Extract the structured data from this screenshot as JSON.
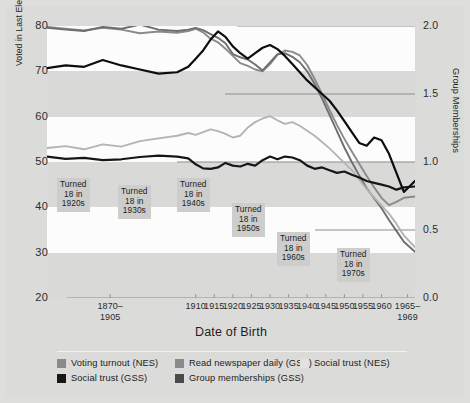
{
  "chart_data": {
    "type": "line",
    "title": "",
    "xlabel": "Date of Birth",
    "ylabel": "Voted in Last Election / Read Newspaper Daily / \"Most People Can Be Trusted\"",
    "y2label": "Group Memberships",
    "xlim": [
      1870,
      1969
    ],
    "ylim": [
      20,
      80
    ],
    "y2lim": [
      0.0,
      2.0
    ],
    "grid": true,
    "legend_position": "bottom-left",
    "yticks": [
      20,
      30,
      40,
      50,
      60,
      70,
      80
    ],
    "y2ticks": [
      "0.0",
      "0.5",
      "1.0",
      "1.5",
      "2.0"
    ],
    "xtick_labels": [
      "1870–\n1905",
      "1910",
      "1915",
      "1920",
      "1925",
      "1930",
      "1935",
      "1940",
      "1945",
      "1950",
      "1955",
      "1960",
      "1965–\n1969"
    ],
    "x": [
      1870,
      1875,
      1880,
      1885,
      1890,
      1895,
      1900,
      1905,
      1908,
      1910,
      1912,
      1914,
      1916,
      1918,
      1920,
      1922,
      1924,
      1926,
      1928,
      1930,
      1932,
      1934,
      1936,
      1938,
      1940,
      1942,
      1944,
      1946,
      1948,
      1950,
      1952,
      1954,
      1956,
      1958,
      1960,
      1962,
      1964,
      1966,
      1969
    ],
    "series": [
      {
        "name": "Voting turnout (NES)",
        "color": "#8a8a8a",
        "axis": "left",
        "values": [
          79.8,
          79.4,
          79.0,
          79.6,
          79.2,
          78.4,
          78.8,
          78.5,
          78.9,
          79.4,
          78.6,
          77.2,
          76.4,
          75.0,
          73.4,
          71.8,
          71.2,
          70.4,
          70.0,
          71.6,
          73.6,
          74.6,
          74.3,
          73.5,
          71.4,
          68.3,
          65.0,
          61.5,
          58.2,
          55.1,
          52.3,
          49.6,
          46.9,
          44.4,
          42.1,
          40.5,
          41.2,
          42.1,
          42.4
        ]
      },
      {
        "name": "Read newspaper daily (GSS)",
        "color": "#6e6e6e",
        "axis": "left",
        "values": [
          79.6,
          79.2,
          78.9,
          79.8,
          79.4,
          80.3,
          79.2,
          78.9,
          79.2,
          79.6,
          79.1,
          78.2,
          77.4,
          76.2,
          73.8,
          73.1,
          72.6,
          71.5,
          70.2,
          72.0,
          73.8,
          74.0,
          73.2,
          72.0,
          70.0,
          67.2,
          64.0,
          60.4,
          56.8,
          53.2,
          50.0,
          47.0,
          44.2,
          42.0,
          39.8,
          37.2,
          34.8,
          32.4,
          30.2
        ]
      },
      {
        "name": "Social trust (NES)",
        "color": "#b4b4b4",
        "axis": "left",
        "values": [
          53.1,
          53.5,
          52.8,
          53.9,
          53.4,
          54.6,
          55.2,
          55.8,
          56.4,
          56.0,
          56.6,
          57.2,
          56.8,
          56.2,
          55.4,
          55.8,
          57.6,
          58.8,
          59.6,
          60.1,
          59.2,
          58.4,
          58.8,
          58.0,
          56.9,
          55.8,
          54.4,
          53.0,
          51.4,
          49.8,
          48.2,
          46.1,
          44.0,
          42.2,
          40.4,
          38.6,
          36.4,
          33.8,
          31.2
        ]
      },
      {
        "name": "Social trust (GSS)",
        "color": "#161616",
        "axis": "left",
        "values": [
          51.2,
          50.7,
          50.9,
          50.4,
          50.6,
          51.1,
          51.4,
          51.2,
          50.8,
          49.5,
          48.6,
          48.5,
          48.8,
          49.8,
          49.2,
          49.0,
          49.6,
          49.2,
          50.4,
          51.2,
          50.6,
          51.2,
          51.0,
          50.4,
          49.2,
          48.5,
          48.8,
          48.2,
          47.6,
          47.9,
          47.2,
          46.6,
          45.8,
          45.4,
          45.0,
          44.6,
          43.9,
          44.4,
          44.6
        ]
      },
      {
        "name": "Group memberships (GSS)",
        "color": "#0d0d0d",
        "axis": "right",
        "values": [
          1.69,
          1.71,
          1.7,
          1.75,
          1.71,
          1.68,
          1.65,
          1.66,
          1.7,
          1.76,
          1.82,
          1.9,
          1.96,
          1.92,
          1.85,
          1.8,
          1.76,
          1.8,
          1.84,
          1.86,
          1.83,
          1.78,
          1.72,
          1.66,
          1.6,
          1.55,
          1.5,
          1.45,
          1.38,
          1.3,
          1.22,
          1.14,
          1.12,
          1.18,
          1.16,
          1.06,
          0.92,
          0.78,
          0.86
        ]
      }
    ],
    "annotations": [
      {
        "lines": [
          "Turned",
          "18 in",
          "1920s"
        ]
      },
      {
        "lines": [
          "Turned",
          "18 in",
          "1930s"
        ]
      },
      {
        "lines": [
          "Turned",
          "18 in",
          "1940s"
        ]
      },
      {
        "lines": [
          "Turned",
          "18 in",
          "1950s"
        ]
      },
      {
        "lines": [
          "Turned",
          "18 in",
          "1960s"
        ]
      },
      {
        "lines": [
          "Turned",
          "18 in",
          "1970s"
        ]
      }
    ]
  },
  "legend": {
    "items": [
      {
        "label": "Voting turnout (NES)",
        "color": "#8a8a8a"
      },
      {
        "label": "Read newspaper daily (GSS)",
        "color": "#8a8a8a"
      },
      {
        "label": "Social trust (NES)",
        "color": "#e2e2e1"
      },
      {
        "label": "Social trust (GSS)",
        "color": "#161616"
      },
      {
        "label": "Group memberships (GSS)",
        "color": "#4a4a4a"
      }
    ]
  },
  "colors": {
    "figure_background": "#dededd",
    "plot_background": "#d9d9d8",
    "band_background": "#fcfcfc",
    "gridline": "#8d8d8d",
    "annotation_background": "#cdcdcc",
    "text": "#1c1c1c"
  }
}
